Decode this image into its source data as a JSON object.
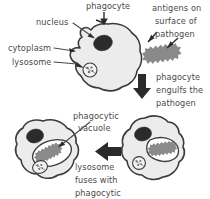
{
  "diagram": {
    "colors": {
      "cytoplasm_fill": "#ececec",
      "cell_outline": "#3b3b3b",
      "nucleus_fill": "#2b2b2b",
      "pathogen_fill": "#8a8a8a",
      "vacuole_fill": "#ffffff",
      "text": "#4a4a4a",
      "arrow": "#2b2b2b",
      "background": "#ffffff"
    }
  },
  "labels": {
    "phagocyte": "phagocyte",
    "nucleus": "nucleus",
    "cytoplasm": "cytoplasm",
    "lysosome": "lysosome",
    "antigens_line1": "antigens on",
    "antigens_line2": "surface of",
    "antigens_line3": "pathogen",
    "engulf_line1": "phagocyte",
    "engulf_line2": "engulfs the",
    "engulf_line3": "pathogen",
    "vacuole_line1": "phagocytic",
    "vacuole_line2": "vacuole",
    "fuses_line1": "lysosome",
    "fuses_line2": "fuses with",
    "fuses_line3": "phagocytic"
  },
  "stages": [
    {
      "name": "phagocyte-and-pathogen",
      "description": "Phagocyte with nucleus, cytoplasm and lysosome beside a pathogen bearing surface antigens"
    },
    {
      "name": "phagocyte-engulfing",
      "description": "Phagocyte extends pseudopodia and engulfs the pathogen"
    },
    {
      "name": "phagocytic-vacuole",
      "description": "Pathogen enclosed in a phagocytic vacuole with lysosome fusing"
    }
  ],
  "arrows": [
    {
      "name": "phagocyte-pointer",
      "direction": "down",
      "style": "thin"
    },
    {
      "name": "antigen-pointer-upper",
      "direction": "down-left",
      "style": "thin"
    },
    {
      "name": "antigen-pointer-lower",
      "direction": "down-left",
      "style": "thin"
    },
    {
      "name": "engulf-step-arrow",
      "direction": "down",
      "style": "block"
    },
    {
      "name": "fusion-step-arrow",
      "direction": "left",
      "style": "block"
    }
  ]
}
